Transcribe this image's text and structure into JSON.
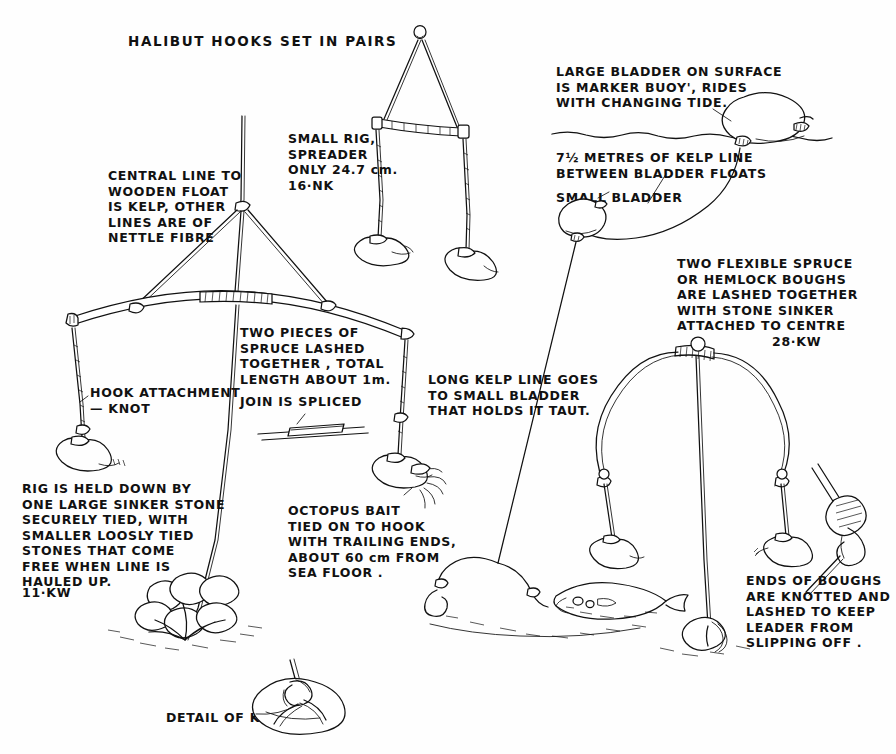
{
  "document": {
    "title": "HALIBUT HOOKS SET IN PAIRS",
    "kind": "hand-drawn ethnographic technical illustration",
    "ink_color": "#111111",
    "paper_color": "#fefefe"
  },
  "annotations": {
    "title": "HALIBUT HOOKS SET IN PAIRS",
    "central_line": "CENTRAL LINE TO\nWOODEN FLOAT\nIS KELP, OTHER\nLINES ARE OF\nNETTLE FIBRE",
    "small_rig": "SMALL RIG,\nSPREADER\nONLY 24.7 cm.\n16·NK",
    "large_bladder": "LARGE BLADDER ON SURFACE\nIS MARKER BUOY', RIDES\nWITH CHANGING TIDE.",
    "kelp_line_between": "7½ METRES OF KELP LINE\nBETWEEN BLADDER FLOATS",
    "small_bladder": "SMALL BLADDER",
    "two_flexible_spruce": "TWO FLEXIBLE SPRUCE\nOR HEMLOCK BOUGHS\nARE LASHED TOGETHER\nWITH STONE SINKER\nATTACHED TO CENTRE",
    "two_flexible_spruce_code": "28·KW",
    "two_pieces_spruce": "TWO PIECES OF\nSPRUCE LASHED\nTOGETHER , TOTAL\nLENGTH ABOUT 1m.",
    "join_is_spliced": "JOIN IS SPLICED",
    "hook_attachment": "HOOK ATTACHMENT\n— KNOT",
    "rig_held_down": "RIG IS HELD DOWN BY\nONE LARGE SINKER STONE\nSECURELY TIED, WITH\nSMALLER LOOSLY TIED\nSTONES THAT COME\nFREE WHEN LINE IS\nHAULED UP.",
    "rig_held_down_code": "11·KW",
    "octopus_bait": "OCTOPUS BAIT\nTIED ON TO HOOK\nWITH TRAILING ENDS,\nABOUT 60 cm FROM\nSEA FLOOR .",
    "long_kelp_line": "LONG KELP LINE GOES\nTO SMALL BLADDER\nTHAT HOLDS IT TAUT.",
    "ends_of_boughs": "ENDS OF BOUGHS\nARE KNOTTED AND\nLASHED TO KEEP\nLEADER FROM\nSLIPPING OFF .",
    "detail_of_knot": "DETAIL OF KNOT"
  },
  "figures": [
    {
      "name": "large-spruce-spreader-rig",
      "description": "Main rig: two pieces of spruce lashed into a wide bowed spreader about 1 m long, suspended from a central kelp line, with a hook hanging from each end and a pile of sinker stones lashed below."
    },
    {
      "name": "small-spreader-rig",
      "description": "Small triangular rig with a short straight wooden spreader of 24.7 cm and a hook at each end."
    },
    {
      "name": "marker-buoy-assembly",
      "description": "Large bladder floating on the sea surface acting as a marker buoy, tethered by 7½ metres of kelp line down to a small bladder that holds the long kelp line taut."
    },
    {
      "name": "bough-rig",
      "description": "Two flexible spruce or hemlock boughs lashed together into an arch with a stone sinker attached at the centre and a baited hook hanging from each knotted end; a halibut is shown on the sea floor."
    },
    {
      "name": "knot-detail",
      "description": "Enlarged detail of the knot lashing a sinker stone."
    },
    {
      "name": "splice-detail",
      "description": "Small detail showing the spliced join between the two spruce pieces."
    },
    {
      "name": "leader-knot-detail",
      "description": "Enlarged detail of the knotted and lashed bough end that keeps the leader from slipping off."
    }
  ]
}
